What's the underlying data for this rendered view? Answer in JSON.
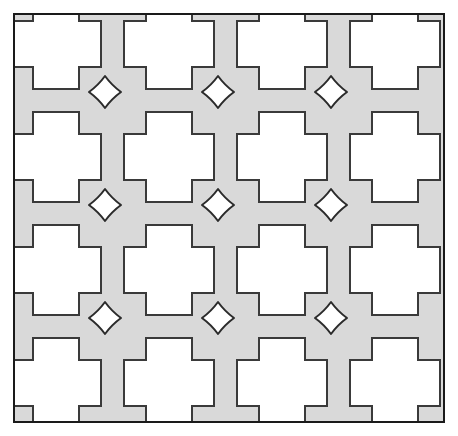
{
  "figure": {
    "title": "Perforated lattice panel pattern",
    "canvas": {
      "width": 458,
      "height": 436,
      "background": "#ffffff"
    }
  },
  "colors": {
    "page_background": "#ffffff",
    "panel_fill": "#d9d9d9",
    "panel_stroke": "#1a1a1a",
    "cutout_fill": "#ffffff",
    "cutout_stroke": "#3a3a3a",
    "star_fill": "#ffffff",
    "star_stroke": "#2b2b2b"
  },
  "panel": {
    "name": "outer-frame",
    "x": 14,
    "y": 14,
    "width": 430,
    "height": 408,
    "stroke_width": 2.0
  },
  "grid": {
    "columns": 4,
    "rows": 4,
    "col_centers": [
      56,
      169,
      282,
      395
    ],
    "row_centers": [
      44,
      157,
      270,
      383
    ],
    "pitch_x": 113,
    "pitch_y": 113,
    "cross_outer_size": 90,
    "cross_bar_size": 46,
    "cutout_stroke_width": 2.0
  },
  "cross_shape": {
    "type": "plus",
    "arm_length": 22,
    "bar_half_width": 23,
    "half_extent": 45,
    "note": "Crosses whose bodies extend past the panel edge are clipped, producing L shapes in the corners and T shapes along the edges."
  },
  "stars": {
    "name": "four-pointed-astroid-star",
    "count": 9,
    "radius": 16,
    "concavity": 0.42,
    "stroke_width": 2.0,
    "col_centers": [
      105,
      218,
      331
    ],
    "row_centers": [
      92,
      205,
      318
    ],
    "positions": [
      {
        "cx": 105,
        "cy": 92
      },
      {
        "cx": 218,
        "cy": 92
      },
      {
        "cx": 331,
        "cy": 92
      },
      {
        "cx": 105,
        "cy": 205
      },
      {
        "cx": 218,
        "cy": 205
      },
      {
        "cx": 331,
        "cy": 205
      },
      {
        "cx": 105,
        "cy": 318
      },
      {
        "cx": 218,
        "cy": 318
      },
      {
        "cx": 331,
        "cy": 318
      }
    ]
  },
  "cutouts": [
    {
      "row": 0,
      "col": 0,
      "cx": 56,
      "cy": 44,
      "clipped": "top-left",
      "visible_shape": "L"
    },
    {
      "row": 0,
      "col": 1,
      "cx": 169,
      "cy": 44,
      "clipped": "top",
      "visible_shape": "T"
    },
    {
      "row": 0,
      "col": 2,
      "cx": 282,
      "cy": 44,
      "clipped": "top",
      "visible_shape": "T"
    },
    {
      "row": 0,
      "col": 3,
      "cx": 395,
      "cy": 44,
      "clipped": "top-right",
      "visible_shape": "L"
    },
    {
      "row": 1,
      "col": 0,
      "cx": 56,
      "cy": 157,
      "clipped": "left",
      "visible_shape": "T-right"
    },
    {
      "row": 1,
      "col": 1,
      "cx": 169,
      "cy": 157,
      "clipped": "none",
      "visible_shape": "plus"
    },
    {
      "row": 1,
      "col": 2,
      "cx": 282,
      "cy": 157,
      "clipped": "none",
      "visible_shape": "plus"
    },
    {
      "row": 1,
      "col": 3,
      "cx": 395,
      "cy": 157,
      "clipped": "right",
      "visible_shape": "T-left"
    },
    {
      "row": 2,
      "col": 0,
      "cx": 56,
      "cy": 270,
      "clipped": "left",
      "visible_shape": "T-right"
    },
    {
      "row": 2,
      "col": 1,
      "cx": 169,
      "cy": 270,
      "clipped": "none",
      "visible_shape": "plus"
    },
    {
      "row": 2,
      "col": 2,
      "cx": 282,
      "cy": 270,
      "clipped": "none",
      "visible_shape": "plus"
    },
    {
      "row": 2,
      "col": 3,
      "cx": 395,
      "cy": 270,
      "clipped": "right",
      "visible_shape": "T-left"
    },
    {
      "row": 3,
      "col": 0,
      "cx": 56,
      "cy": 383,
      "clipped": "bottom-left",
      "visible_shape": "L"
    },
    {
      "row": 3,
      "col": 1,
      "cx": 169,
      "cy": 383,
      "clipped": "bottom",
      "visible_shape": "T-up"
    },
    {
      "row": 3,
      "col": 2,
      "cx": 282,
      "cy": 383,
      "clipped": "bottom",
      "visible_shape": "T-up"
    },
    {
      "row": 3,
      "col": 3,
      "cx": 395,
      "cy": 383,
      "clipped": "bottom-right",
      "visible_shape": "L"
    }
  ]
}
